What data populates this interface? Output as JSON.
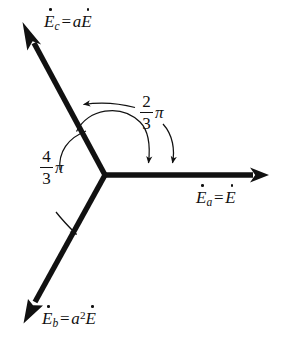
{
  "figure": {
    "background_color": "#ffffff",
    "stroke_color": "#111111",
    "canvas": {
      "width": 286,
      "height": 347
    }
  },
  "vectors": [
    {
      "id": "Ea",
      "name": "phasor-ea",
      "label_parts": {
        "symbol": "E",
        "subscript": "a",
        "equals": "=",
        "expr_coef": "",
        "expr_sym": "E",
        "exponent": ""
      },
      "label_text": "Ėa = Ė",
      "angle_deg": 0,
      "direction": "right",
      "origin": [
        105,
        175
      ],
      "tip": [
        268,
        175
      ],
      "label_pos": [
        196,
        188
      ]
    },
    {
      "id": "Ec",
      "name": "phasor-ec",
      "label_parts": {
        "symbol": "E",
        "subscript": "c",
        "equals": "=",
        "expr_coef": "a",
        "expr_sym": "E",
        "exponent": ""
      },
      "label_text": "Ėc = aĖ",
      "angle_deg": 120,
      "direction": "upper-left",
      "origin": [
        105,
        175
      ],
      "tip": [
        23,
        23
      ],
      "label_pos": [
        44,
        22
      ]
    },
    {
      "id": "Eb",
      "name": "phasor-eb",
      "label_parts": {
        "symbol": "E",
        "subscript": "b",
        "equals": "=",
        "expr_coef": "a",
        "expr_sym": "E",
        "exponent": "2"
      },
      "label_text": "Ėb = a²Ė",
      "angle_deg": 240,
      "direction": "lower-left",
      "origin": [
        105,
        175
      ],
      "tip": [
        24,
        322
      ],
      "label_pos": [
        42,
        312
      ]
    }
  ],
  "angles": [
    {
      "id": "angle-2-3-pi",
      "name": "angle-label-two-thirds-pi",
      "numerator": "2",
      "denominator": "3",
      "symbol": "π",
      "text": "2/3 π",
      "from_vector": "Ea",
      "to_vector": "Ec",
      "value_rad_display": "2π/3",
      "label_pos": [
        148,
        97
      ]
    },
    {
      "id": "angle-4-3-pi",
      "name": "angle-label-four-thirds-pi",
      "numerator": "4",
      "denominator": "3",
      "symbol": "π",
      "text": "4/3 π",
      "from_vector": "Ea",
      "to_vector": "Eb",
      "value_rad_display": "4π/3",
      "label_pos": [
        44,
        152
      ]
    }
  ]
}
